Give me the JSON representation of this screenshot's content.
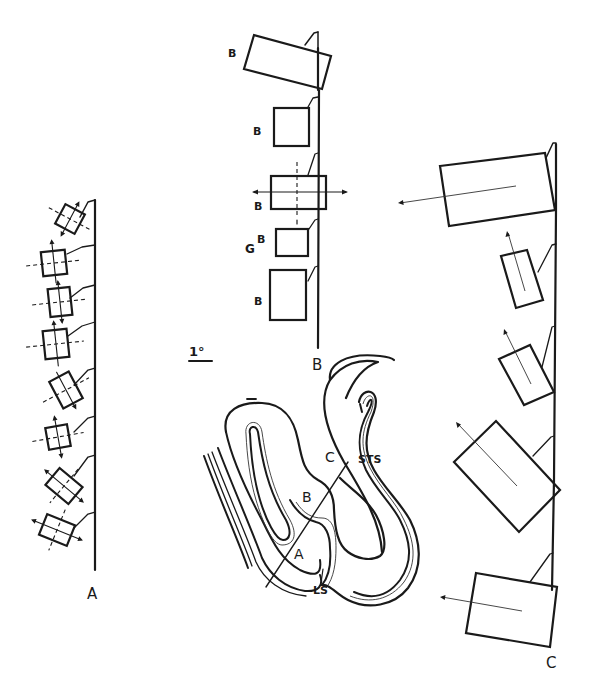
{
  "figure": {
    "colors": {
      "ink": "#1a1a1a",
      "background": "#ffffff"
    },
    "scale_bar": {
      "label": "1°"
    },
    "track_a": {
      "track_label": "A",
      "receptive_field_count": 8
    },
    "track_b": {
      "track_label": "B",
      "rf_labels": [
        "B",
        "B",
        "B",
        "B",
        "B"
      ],
      "g_label": "G"
    },
    "track_c": {
      "track_label": "C",
      "receptive_field_count": 5
    },
    "section": {
      "labels": {
        "point_a": "A",
        "point_b": "B",
        "point_c": "C",
        "sts": "STS",
        "ls": "LS"
      }
    }
  }
}
